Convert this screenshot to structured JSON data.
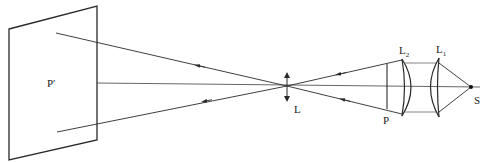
{
  "diagram": {
    "type": "optical-projection-diagram",
    "labels": {
      "screen": "P′",
      "projection_lens": "L",
      "slide": "P",
      "condenser_lens_2": "L",
      "condenser_lens_2_sub": "2",
      "condenser_lens_1": "L",
      "condenser_lens_1_sub": "1",
      "source": "S"
    },
    "components": [
      {
        "id": "screen",
        "label": "P′",
        "kind": "screen"
      },
      {
        "id": "projection_lens",
        "label": "L",
        "kind": "convex-lens-symbol"
      },
      {
        "id": "slide",
        "label": "P",
        "kind": "object-plane"
      },
      {
        "id": "condenser_lens_2",
        "label": "L2",
        "kind": "plano-convex-lens"
      },
      {
        "id": "condenser_lens_1",
        "label": "L1",
        "kind": "plano-convex-lens"
      },
      {
        "id": "source",
        "label": "S",
        "kind": "point-source"
      }
    ],
    "colors": {
      "stroke": "#2a2a2a",
      "background": "#ffffff"
    }
  }
}
